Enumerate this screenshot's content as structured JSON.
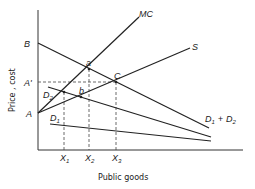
{
  "diagram": {
    "axes": {
      "x_label": "Public goods",
      "y_label": "Price , cost"
    },
    "curves": {
      "mc": "MC",
      "s": "S",
      "d1": "D",
      "d1_sub": "1",
      "d2": "D",
      "d2_sub": "2",
      "sum": "D",
      "sum_sub1": "1",
      "sum_plus": "+",
      "sum_d2": "D",
      "sum_sub2": "2"
    },
    "points": {
      "a": "a",
      "b": "b",
      "c": "C",
      "A": "A",
      "A_prime": "A'",
      "B": "B"
    },
    "x_ticks": [
      {
        "label": "X",
        "sub": "1"
      },
      {
        "label": "X",
        "sub": "2"
      },
      {
        "label": "X",
        "sub": "3"
      }
    ]
  }
}
